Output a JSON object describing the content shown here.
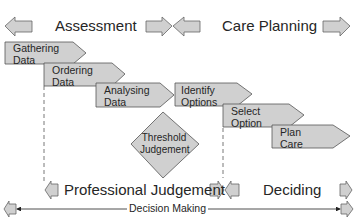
{
  "phases_top": {
    "assessment": "Assessment",
    "care_planning": "Care Planning"
  },
  "phases_bottom": {
    "professional_judgement": "Professional Judgement",
    "deciding": "Deciding"
  },
  "steps": [
    {
      "line1": "Gathering",
      "line2": "Data"
    },
    {
      "line1": "Ordering",
      "line2": "Data"
    },
    {
      "line1": "Analysing",
      "line2": "Data"
    },
    {
      "line1": "Identify",
      "line2": "Options"
    },
    {
      "line1": "Select",
      "line2": "Option"
    },
    {
      "line1": "Plan",
      "line2": "Care"
    }
  ],
  "decision_node": {
    "line1": "Threshold",
    "line2": "Judgement"
  },
  "axis": {
    "label": "Decision Making"
  },
  "colors": {
    "shape_fill": "#d0d0d0",
    "stroke": "#555555"
  }
}
